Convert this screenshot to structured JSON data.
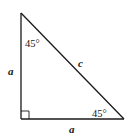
{
  "diagram": {
    "type": "right-isosceles-triangle",
    "colors": {
      "stroke": "#1a1a1a",
      "background": "#ffffff"
    },
    "vertices": {
      "top": [
        21,
        13
      ],
      "right_angle": [
        21,
        119
      ],
      "bottom_right": [
        124,
        119
      ]
    },
    "labels": {
      "top_angle": "45°",
      "bottom_right_angle": "45°",
      "left_side": "a",
      "bottom_side": "a",
      "hypotenuse": "c"
    },
    "right_angle_marker": true
  }
}
